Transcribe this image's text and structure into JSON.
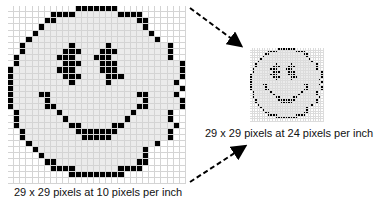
{
  "figure": {
    "large_image": {
      "caption": "29 x 29 pixels at 10 pixels per inch",
      "grid_size": 29,
      "resolution_ppi": 10
    },
    "small_image": {
      "caption": "29 x 29 pixels at 24 pixels per inch",
      "grid_size": 29,
      "resolution_ppi": 24
    },
    "colors": {
      "pixel_on": "#000000",
      "face_fill": "#ebebeb",
      "background": "#ffffff",
      "grid_line": "#d4d4d4"
    },
    "legend": "o = outside, f = face fill, b = black pixel",
    "pixels": [
      "ooooooooooobbbbbbbooooooooooo",
      "ooooooobbbbfffffffbbbbooooooo",
      "oooooobbfffffffffffffbbooooooo",
      "ooooobffffffffffffffffbooooo",
      "oooobffffffffffffffffffbooooo",
      "ooobffffffffffffffffffffboooo",
      "oobfffffffbfffffbfffffffffbooo",
      "oobffffffbbbfffbbbffffffffboo",
      "obffffffbbbfffbbbfffffffffbo",
      "obfffffffbbbfffbbbffffffffffbo",
      "bfffffffbbbffffbbbffffffffffb",
      "bffffffffbbbffffbbbfffffffffb",
      "bfffffffffbfffffbffffffffffb",
      "bfffffffffffffffffffffffffffb",
      "bffffbbffffffffffffffbbffffb",
      "bfffffbfffffffffffffffbfffffb",
      "bfffffbbfffffffffffffbbfffffb",
      "obffffffbfffffffffffbfffffbo",
      "obfffffffbfffffffffbffffffbo",
      "obffffffffbbfffffbbffffffffbo",
      "oobffffffffbbbbbbbffffffffbo",
      "oobfffffffffbbbbbfffffffffboo",
      "ooobffffffffffffffffffffboooo",
      "oooobfffffffffffffffffboooo",
      "ooooobffffffffffffffffbooooo",
      "oooooobbfffffffffffffbbooooo",
      "ooooooobbbbfffffffbbbbooooooo",
      "oooooooooobbbbbbbbboooooooooo",
      "ooooooooooooooooooooooooooooo"
    ]
  }
}
